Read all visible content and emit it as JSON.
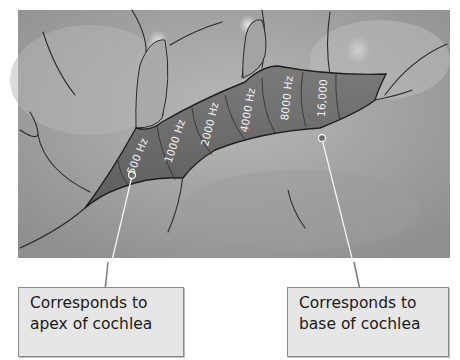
{
  "figure": {
    "frequency_bands": [
      {
        "label": "500 Hz"
      },
      {
        "label": "1000 Hz"
      },
      {
        "label": "2000 Hz"
      },
      {
        "label": "4000 Hz"
      },
      {
        "label": "8000 Hz"
      },
      {
        "label": "16,000"
      }
    ],
    "callouts": {
      "left": {
        "line1": "Corresponds to",
        "line2": "apex of cochlea"
      },
      "right": {
        "line1": "Corresponds to",
        "line2": "base of cochlea"
      }
    },
    "colors": {
      "brain_surface": "#a6a6a6",
      "auditory_strip": "#6e6e6e",
      "outline": "#2a2a2a",
      "label_box": "#e6e6e6"
    }
  }
}
